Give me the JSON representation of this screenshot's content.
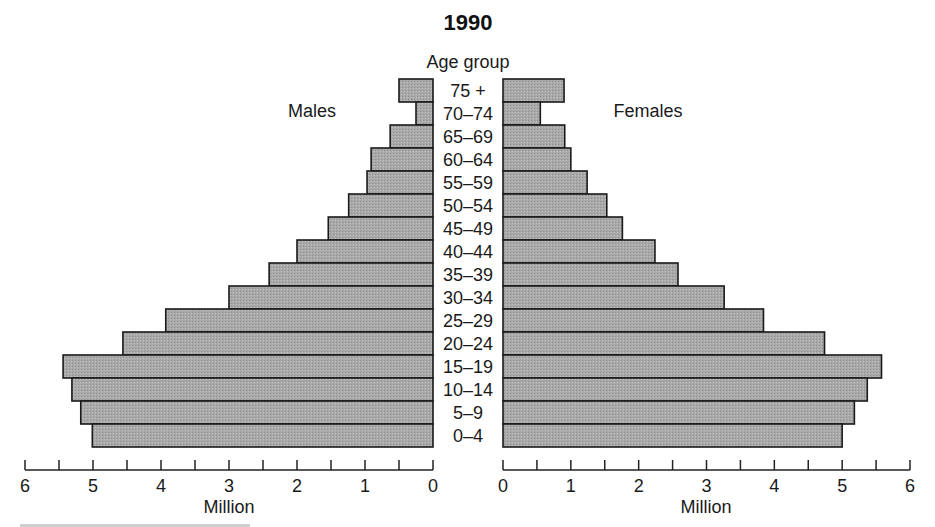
{
  "chart_data": {
    "type": "bar",
    "subtype": "population-pyramid",
    "title": "1990",
    "category_axis_label": "Age group",
    "categories": [
      "75 +",
      "70–74",
      "65–69",
      "60–64",
      "55–59",
      "50–54",
      "45–49",
      "40–44",
      "35–39",
      "30–34",
      "25–29",
      "20–24",
      "15–19",
      "10–14",
      "5–9",
      "0–4"
    ],
    "series": [
      {
        "name": "Males",
        "side": "left",
        "values": [
          0.5,
          0.25,
          0.63,
          0.91,
          0.97,
          1.24,
          1.54,
          2.0,
          2.41,
          3.0,
          3.93,
          4.56,
          5.44,
          5.31,
          5.18,
          5.01
        ]
      },
      {
        "name": "Females",
        "side": "right",
        "values": [
          0.9,
          0.55,
          0.91,
          1.0,
          1.24,
          1.53,
          1.76,
          2.24,
          2.58,
          3.26,
          3.84,
          4.74,
          5.58,
          5.37,
          5.18,
          5.0
        ]
      }
    ],
    "xlabel": "Million",
    "xlim": [
      0,
      6
    ],
    "major_ticks": [
      0,
      1,
      2,
      3,
      4,
      5,
      6
    ],
    "minor_tick_step": 0.5,
    "grid": false,
    "bar_fill": "#a9a9a9",
    "bar_stroke": "#1a1a1a"
  }
}
